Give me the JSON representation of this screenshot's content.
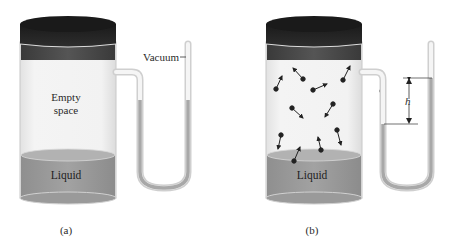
{
  "figure": {
    "panels": [
      {
        "id": "a",
        "caption": "(a)",
        "container_label": "Empty space",
        "container_label_lines": [
          "Empty",
          "space"
        ],
        "liquid_label": "Liquid",
        "manometer_label": "Vacuum",
        "molecules": 0
      },
      {
        "id": "b",
        "caption": "(b)",
        "liquid_label": "Liquid",
        "height_label": "h",
        "molecules": 12
      }
    ],
    "colors": {
      "lid_dark": "#1f1f1f",
      "lid_band": "#4a4a4a",
      "glass": "#ececec",
      "glass_edge": "#c8c8c8",
      "liquid": "#9a9a9a",
      "liquid_top": "#b0b0b0",
      "mercury": "#a8a8a8",
      "molecule": "#222222"
    }
  }
}
